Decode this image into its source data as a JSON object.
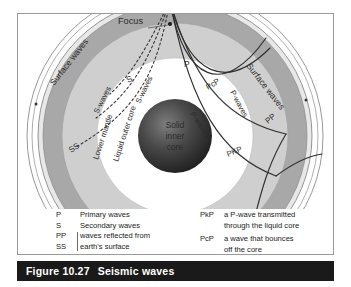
{
  "figure": {
    "number": "Figure 10.27",
    "title": "Seismic waves"
  },
  "diagram": {
    "focus_label": "Focus",
    "layers": [
      {
        "name": "Lower mantle",
        "label": "Lower mantle",
        "color": "#c9c9c9"
      },
      {
        "name": "Liquid outer core",
        "label": "Liquid outer core",
        "color": "#ffffff"
      },
      {
        "name": "Solid inner core",
        "label_line1": "Solid",
        "label_line2": "inner",
        "label_line3": "core",
        "color": "#3a3a3a"
      }
    ],
    "surface_wave_left": "Surface waves",
    "surface_wave_right": "Surface waves",
    "ray_labels": {
      "p": "P",
      "s": "S",
      "ss": "SS",
      "pp": "PP",
      "pcp": "PcP",
      "pkp": "PKP",
      "s_waves_a": "S-waves",
      "s_waves_b": "S-waves",
      "s_waves_c": "S-waves",
      "p_waves_a": "P-waves",
      "p_waves_b": "P-waves"
    },
    "colors": {
      "mantle_band": "#a8a8a8",
      "lower_mantle": "#cfcfcf",
      "outer_core": "#ffffff",
      "inner_core": "#2f2f2f",
      "ray_line": "#333333",
      "frame": "#9a9a9a"
    }
  },
  "legend": {
    "left": [
      {
        "key": "P",
        "text": "Primary waves"
      },
      {
        "key": "S",
        "text": "Secondary waves"
      }
    ],
    "left_pair": {
      "key1": "PP",
      "key2": "SS",
      "line1": "waves reflected from",
      "line2": "earth's surface"
    },
    "right": [
      {
        "key": "PkP",
        "line1": "a P-wave transmitted",
        "line2": "through the liquid core"
      },
      {
        "key": "PcP",
        "line1": "a wave that bounces",
        "line2": "off the core"
      }
    ]
  }
}
